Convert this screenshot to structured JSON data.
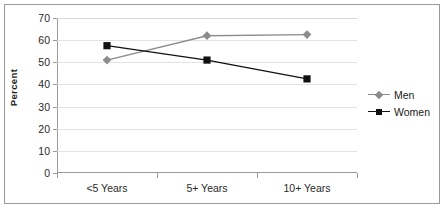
{
  "chart_data": {
    "type": "line",
    "title": "",
    "subtitle": "",
    "xlabel": "",
    "ylabel": "Percent",
    "categories": [
      "<5 Years",
      "5+ Years",
      "10+ Years"
    ],
    "ylim": [
      0,
      70
    ],
    "yticks": [
      0,
      10,
      20,
      30,
      40,
      50,
      60,
      70
    ],
    "ytick_labels": [
      "0",
      "10",
      "20",
      "30",
      "40",
      "50",
      "60",
      "70"
    ],
    "grid": true,
    "legend_position": "right",
    "series": [
      {
        "name": "Men",
        "values": [
          51,
          62,
          62.5
        ],
        "color": "#8c8c8c",
        "marker": "diamond"
      },
      {
        "name": "Women",
        "values": [
          57.5,
          51,
          42.5
        ],
        "color": "#111111",
        "marker": "square"
      }
    ]
  },
  "legend": {
    "items": [
      {
        "label": "Men"
      },
      {
        "label": "Women"
      }
    ]
  },
  "colors": {
    "men": "#8c8c8c",
    "women": "#111111",
    "grid": "#e2e2e2",
    "axis": "#9a9a9a",
    "text": "#2b2b2b",
    "background": "#ffffff"
  }
}
